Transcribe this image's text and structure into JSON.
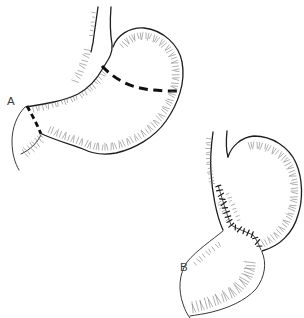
{
  "figure": {
    "kind": "two-panel surgical line drawing of a stomach",
    "colors": {
      "background": "#ffffff",
      "ink": "#1e1e1e",
      "hatch": "#6e6e6e",
      "label": "#3c3c3c"
    },
    "panels": {
      "a": {
        "label": "A",
        "depicts": "stomach with thick dashed resection lines across the gastric body and across the duodenum just beyond the pylorus"
      },
      "b": {
        "label": "B",
        "depicts": "remaining stomach pouch joined to the duodenum by a stitched suture line (anastomosis)"
      }
    }
  }
}
